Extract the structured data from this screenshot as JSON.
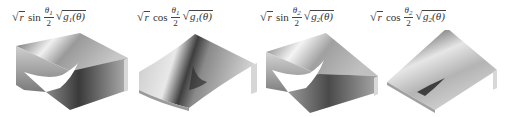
{
  "figure": {
    "panels": [
      {
        "id": "p1",
        "label": {
          "radicand": "r",
          "trig": "sin",
          "frac_num": "θ",
          "frac_num_sub": "1",
          "frac_den": "2",
          "g": "g",
          "g_sub": "1",
          "g_arg": "(θ)"
        },
        "surface": "sin-branch-cut"
      },
      {
        "id": "p2",
        "label": {
          "radicand": "r",
          "trig": "cos",
          "frac_num": "θ",
          "frac_num_sub": "1",
          "frac_den": "2",
          "g": "g",
          "g_sub": "1",
          "g_arg": "(θ)"
        },
        "surface": "cos-smooth-fold"
      },
      {
        "id": "p3",
        "label": {
          "radicand": "r",
          "trig": "sin",
          "frac_num": "θ",
          "frac_num_sub": "2",
          "frac_den": "2",
          "g": "g",
          "g_sub": "2",
          "g_arg": "(θ)"
        },
        "surface": "sin-branch-cut"
      },
      {
        "id": "p4",
        "label": {
          "radicand": "r",
          "trig": "cos",
          "frac_num": "θ",
          "frac_num_sub": "2",
          "frac_den": "2",
          "g": "g",
          "g_sub": "2",
          "g_arg": "(θ)"
        },
        "surface": "cos-smooth-fold"
      }
    ],
    "colors": {
      "surface_light": "#f2f2f2",
      "surface_mid": "#a8a8a8",
      "surface_dark": "#3a3a3a",
      "edge": "#bdbdbd"
    }
  }
}
